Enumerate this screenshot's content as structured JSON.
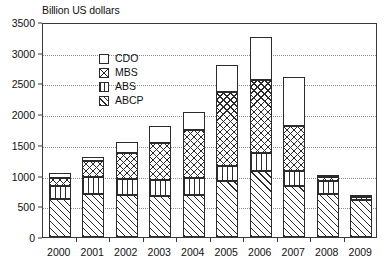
{
  "chart_data": {
    "type": "bar",
    "stacked": true,
    "title": "Billion US dollars",
    "xlabel": "",
    "ylabel": "",
    "ylim": [
      0,
      3500
    ],
    "ytick_step": 500,
    "yticks": [
      0,
      500,
      1000,
      1500,
      2000,
      2500,
      3000,
      3500
    ],
    "ytick_labels": [
      "0",
      "500",
      "1000",
      "1500",
      "2000",
      "2500",
      "3000",
      "3500"
    ],
    "grid": true,
    "grid_style": "dotted",
    "legend_position": "upper-left-inside",
    "categories": [
      "2000",
      "2001",
      "2002",
      "2003",
      "2004",
      "2005",
      "2006",
      "2007",
      "2008",
      "2009"
    ],
    "stack_order_bottom_to_top": [
      "ABCP",
      "ABS",
      "MBS",
      "CDO"
    ],
    "series": [
      {
        "name": "ABCP",
        "pattern": "diagonal-hatch",
        "values": [
          620,
          705,
          690,
          670,
          680,
          915,
          1080,
          830,
          700,
          600
        ]
      },
      {
        "name": "ABS",
        "pattern": "vertical-lines",
        "values": [
          210,
          265,
          250,
          260,
          280,
          245,
          285,
          250,
          205,
          50
        ]
      },
      {
        "name": "MBS",
        "pattern": "cross-hatch",
        "values": [
          130,
          260,
          420,
          600,
          790,
          1200,
          1185,
          720,
          70,
          10
        ]
      },
      {
        "name": "CDO",
        "pattern": "solid-white",
        "values": [
          90,
          80,
          180,
          270,
          280,
          440,
          700,
          800,
          25,
          0
        ]
      }
    ],
    "totals": [
      1050,
      1310,
      1540,
      1800,
      2030,
      2800,
      3250,
      2600,
      1000,
      660
    ]
  },
  "legend": {
    "items": [
      {
        "label": "CDO",
        "key": "cdo"
      },
      {
        "label": "MBS",
        "key": "mbs"
      },
      {
        "label": "ABS",
        "key": "abs"
      },
      {
        "label": "ABCP",
        "key": "abcp"
      }
    ]
  }
}
